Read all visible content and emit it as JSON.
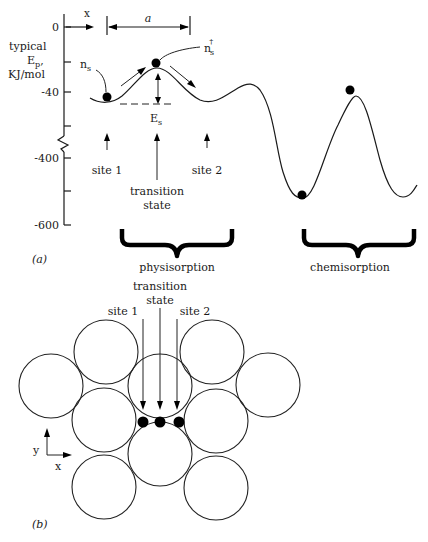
{
  "panel_a": {
    "label": "(a)",
    "y_axis": {
      "title_line1": "typical",
      "title_line2": "E",
      "title_sub": "p",
      "title_line3": "KJ/mol",
      "ticks": [
        "0",
        "-40",
        "-400",
        "-600"
      ],
      "axis_break": true
    },
    "x_arrow_label": "x",
    "lattice_spacing_label": "a",
    "adsorbate_label": "n",
    "adsorbate_sub": "s",
    "transition_adsorbate_label": "n",
    "transition_adsorbate_sub": "s",
    "transition_adsorbate_sup": "†",
    "barrier_label": "E",
    "barrier_sub": "s",
    "site1_label": "site 1",
    "transition_line1": "transition",
    "transition_line2": "state",
    "site2_label": "site 2",
    "physisorption_label": "physisorption",
    "chemisorption_label": "chemisorption"
  },
  "panel_b": {
    "label": "(b)",
    "transition_line1": "transition",
    "transition_line2": "state",
    "site1_label": "site 1",
    "site2_label": "site 2",
    "axis_y_label": "y",
    "axis_x_label": "x",
    "atom_count": 10,
    "adatom_positions": [
      "site 1",
      "transition state",
      "site 2"
    ]
  },
  "colors": {
    "ink": "#1a1a1a",
    "background": "#ffffff"
  }
}
